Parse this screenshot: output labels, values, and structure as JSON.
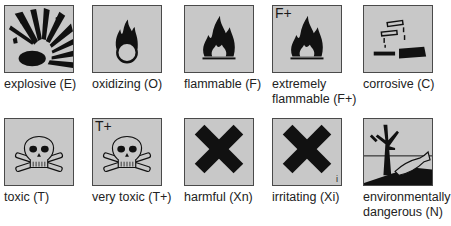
{
  "symbols": [
    {
      "name": "explosive",
      "label": "explosive (E)",
      "code": "E",
      "icon": "explosion-icon"
    },
    {
      "name": "oxidizing",
      "label": "oxidizing (O)",
      "code": "O",
      "icon": "flame-over-circle-icon"
    },
    {
      "name": "flammable",
      "label": "flammable (F)",
      "code": "F",
      "icon": "flame-icon"
    },
    {
      "name": "extremely-flammable",
      "label_line1": "extremely",
      "label_line2": "flammable (F+)",
      "code": "F+",
      "icon_text": "F+",
      "icon": "flame-icon"
    },
    {
      "name": "corrosive",
      "label": "corrosive (C)",
      "code": "C",
      "icon": "corrosion-icon"
    },
    {
      "name": "toxic",
      "label": "toxic (T)",
      "code": "T",
      "icon": "skull-crossbones-icon"
    },
    {
      "name": "very-toxic",
      "label": "very toxic (T+)",
      "code": "T+",
      "icon_text": "T+",
      "icon": "skull-crossbones-icon"
    },
    {
      "name": "harmful",
      "label": "harmful (Xn)",
      "code": "Xn",
      "icon": "saltire-cross-icon"
    },
    {
      "name": "irritating",
      "label": "irritating (Xi)",
      "code": "Xi",
      "icon_text": "i",
      "icon": "saltire-cross-icon"
    },
    {
      "name": "environmentally-dangerous",
      "label_line1": "environmentally",
      "label_line2": "dangerous (N)",
      "code": "N",
      "icon": "dead-tree-fish-icon"
    }
  ],
  "colors": {
    "symbol_background": "#c8c8c8",
    "symbol_border": "#4a4a4a",
    "glyph": "#111111",
    "text": "#222222"
  }
}
